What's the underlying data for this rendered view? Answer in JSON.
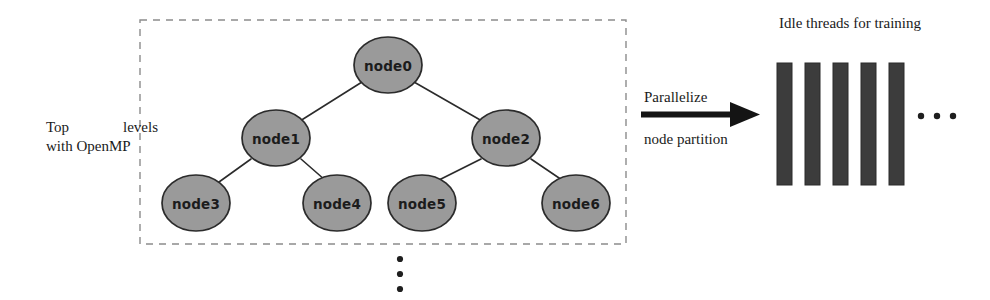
{
  "figure": {
    "background": "#ffffff"
  },
  "colors": {
    "node_fill": "#9a9a9a",
    "node_stroke": "#2b2b2b",
    "edge": "#2b2b2b",
    "dashed_box": "#8c8c8c",
    "thread_bar": "#3c3c3c",
    "thread_bar_stroke": "#2a2a2a",
    "text": "#1a1a1a",
    "dots": "#1f1f1f"
  },
  "left_panel": {
    "caption_word_1": "Top",
    "caption_word_2": "levels",
    "caption_line_2": "with OpenMP",
    "dashed_box": {
      "x": 140,
      "y": 20,
      "width": 486,
      "height": 224
    }
  },
  "tree": {
    "nodes": [
      {
        "id": "node0",
        "label": "node0",
        "cx": 388,
        "cy": 65,
        "rx": 34,
        "ry": 28
      },
      {
        "id": "node1",
        "label": "node1",
        "cx": 276,
        "cy": 138,
        "rx": 34,
        "ry": 28
      },
      {
        "id": "node2",
        "label": "node2",
        "cx": 506,
        "cy": 138,
        "rx": 34,
        "ry": 28
      },
      {
        "id": "node3",
        "label": "node3",
        "cx": 196,
        "cy": 203,
        "rx": 34,
        "ry": 28
      },
      {
        "id": "node4",
        "label": "node4",
        "cx": 337,
        "cy": 203,
        "rx": 34,
        "ry": 28
      },
      {
        "id": "node5",
        "label": "node5",
        "cx": 422,
        "cy": 203,
        "rx": 34,
        "ry": 28
      },
      {
        "id": "node6",
        "label": "node6",
        "cx": 576,
        "cy": 203,
        "rx": 34,
        "ry": 28
      }
    ],
    "edges": [
      {
        "from": "node0",
        "to": "node1"
      },
      {
        "from": "node0",
        "to": "node2"
      },
      {
        "from": "node1",
        "to": "node3"
      },
      {
        "from": "node1",
        "to": "node4"
      },
      {
        "from": "node2",
        "to": "node5"
      },
      {
        "from": "node2",
        "to": "node6"
      }
    ],
    "continuation_dots": {
      "count": 3,
      "orientation": "vertical",
      "cx": 400,
      "cy_start": 259,
      "spacing": 15
    }
  },
  "transform_arrow": {
    "label_above": "Parallelize",
    "label_below": "node partition",
    "x_start": 641,
    "x_end": 758,
    "y": 115
  },
  "right_panel": {
    "title": "Idle threads for training",
    "thread_bars": [
      {
        "index": 1,
        "x": 777,
        "y": 63,
        "width": 15,
        "height": 122
      },
      {
        "index": 2,
        "x": 805,
        "y": 63,
        "width": 15,
        "height": 122
      },
      {
        "index": 3,
        "x": 833,
        "y": 63,
        "width": 15,
        "height": 122
      },
      {
        "index": 4,
        "x": 861,
        "y": 63,
        "width": 15,
        "height": 122
      },
      {
        "index": 5,
        "x": 889,
        "y": 63,
        "width": 15,
        "height": 122
      }
    ],
    "continuation_dots": {
      "count": 3,
      "orientation": "horizontal",
      "cx_start": 921,
      "cy": 116,
      "spacing": 16
    }
  }
}
